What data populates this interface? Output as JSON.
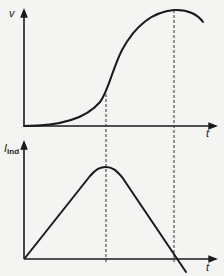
{
  "diagram": {
    "top_plot": {
      "y_label": "v",
      "x_label": "t",
      "curve": "s-shaped-velocity",
      "description": "Velocity rises slowly, inflects, then peaks and begins to fall"
    },
    "bottom_plot": {
      "y_label_main": "I",
      "y_label_sub": "ind",
      "x_label": "t",
      "curve": "triangular-current",
      "description": "Induced current rises linearly to a peak, then falls linearly through zero"
    },
    "guides": [
      {
        "name": "inflection-guide",
        "meaning": "velocity inflection aligns with current peak"
      },
      {
        "name": "peak-guide",
        "meaning": "velocity peak aligns with current zero crossing"
      }
    ],
    "colors": {
      "ink": "#1a1a1a",
      "background": "#f4f4f2"
    }
  }
}
